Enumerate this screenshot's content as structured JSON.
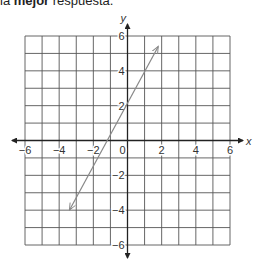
{
  "instruction": {
    "prefix": "la ",
    "bold": "mejor",
    "suffix": " respuesta."
  },
  "chart_data": {
    "type": "line",
    "title": "",
    "xlabel": "x",
    "ylabel": "y",
    "xlim": [
      -6,
      6
    ],
    "ylim": [
      -6,
      6
    ],
    "grid": true,
    "x_ticks": [
      -6,
      -4,
      -2,
      0,
      2,
      4,
      6
    ],
    "y_ticks": [
      -6,
      -4,
      -2,
      2,
      4,
      6
    ],
    "x_tick_labels": [
      "−6",
      "−4",
      "−2",
      "0",
      "2",
      "4",
      "6"
    ],
    "y_tick_labels": [
      "6",
      "4",
      "2",
      "−2",
      "−4",
      "−6"
    ],
    "series": [
      {
        "name": "line",
        "points": [
          [
            -3.4,
            -4.0
          ],
          [
            0,
            2
          ],
          [
            1.8,
            5.4
          ]
        ],
        "arrows": "both",
        "y_intercept": 2,
        "x_intercept": -1.1,
        "approx_slope": 1.8
      }
    ]
  },
  "colors": {
    "grid": "#555555",
    "axis": "#222222",
    "line": "#888888"
  }
}
